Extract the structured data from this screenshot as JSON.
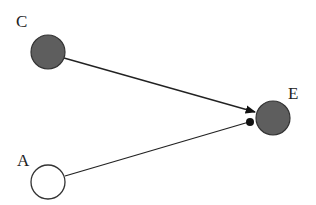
{
  "diagram": {
    "nodes": [
      {
        "id": "C",
        "label": "C",
        "fill": "#5e5e5e"
      },
      {
        "id": "E",
        "label": "E",
        "fill": "#5e5e5e"
      },
      {
        "id": "A",
        "label": "A",
        "fill": "#ffffff"
      }
    ],
    "edges": [
      {
        "from": "C",
        "to": "E",
        "head": "arrow"
      },
      {
        "from": "A",
        "to": "E",
        "head": "dot"
      }
    ]
  }
}
